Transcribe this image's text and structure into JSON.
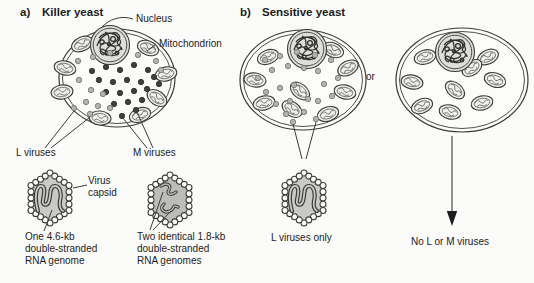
{
  "figure": {
    "panel_a": {
      "label": "a)",
      "title": "Killer yeast",
      "nucleus_label": "Nucleus",
      "mitochondrion_label": "Mitochondrion",
      "l_viruses_label": "L viruses",
      "m_viruses_label": "M viruses",
      "capsid_label_line1": "Virus",
      "capsid_label_line2": "capsid",
      "l_genome_caption": [
        "One 4.6-kb",
        "double-stranded",
        "RNA genome"
      ],
      "m_genome_caption": [
        "Two identical 1.8-kb",
        "double-stranded",
        "RNA genomes"
      ]
    },
    "panel_b": {
      "label": "b)",
      "title": "Sensitive yeast",
      "conjunction": "or",
      "left_cell_caption": "L viruses only",
      "right_cell_caption": "No L or M viruses"
    }
  },
  "icons": {
    "nucleus": "scribbled-double-circle",
    "mitochondrion": "oval-with-cristae",
    "l_virus_particle": "light-gray-dot",
    "m_virus_particle": "dark-dot",
    "virus_capsid": "beaded-hexagon",
    "rna_genome": "wavy-double-line",
    "result_arrow": "down-arrow"
  },
  "colors": {
    "background": "#fbfbf9",
    "ink": "#1c1c1c",
    "line": "#3a3a3a",
    "cell_fill": "#fcfcfa",
    "nucleus_fill": "#dededa",
    "mitochondrion_fill": "#f0f0ec",
    "l_virus_dot": "#b3b3b0",
    "m_virus_dot": "#3f3f3c",
    "l_capsid_fill": "#c9c9c6",
    "m_capsid_fill": "#bcbcb9",
    "capsid_bead_fill": "#fdfdfb"
  }
}
